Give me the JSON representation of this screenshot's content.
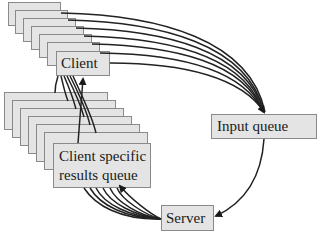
{
  "diagram": {
    "client_label": "Client",
    "results_label_line1": "Client specific",
    "results_label_line2": "results queue",
    "input_queue_label": "Input queue",
    "server_label": "Server",
    "client_stack_count": 7,
    "results_stack_count": 7,
    "colors": {
      "box_fill": "#e4e4e4",
      "box_border": "#8a8a8a",
      "arrow": "#1a1a1a",
      "background": "#ffffff"
    }
  }
}
